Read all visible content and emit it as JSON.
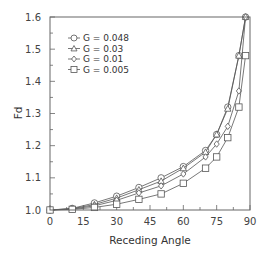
{
  "chart_data": {
    "type": "line",
    "title": "",
    "xlabel": "Receding Angle",
    "ylabel": "Fd",
    "xlim": [
      0,
      90
    ],
    "ylim": [
      1.0,
      1.6
    ],
    "xticks": [
      0,
      15,
      30,
      45,
      60,
      75,
      90
    ],
    "xtick_labels": [
      "0",
      "15",
      "30",
      "45",
      "60",
      "75",
      "90"
    ],
    "yticks": [
      1.0,
      1.1,
      1.2,
      1.3,
      1.4,
      1.5,
      1.6
    ],
    "ytick_labels": [
      "1.0",
      "1.1",
      "1.2",
      "1.3",
      "1.4",
      "1.5",
      "1.6"
    ],
    "grid": false,
    "legend_position": "upper-left",
    "series": [
      {
        "name": "G = 0.048",
        "marker": "circle",
        "x": [
          0,
          10,
          20,
          30,
          40,
          50,
          60,
          70,
          75,
          80,
          85,
          88
        ],
        "y": [
          1.0,
          1.005,
          1.022,
          1.043,
          1.07,
          1.1,
          1.135,
          1.185,
          1.235,
          1.32,
          1.48,
          1.6
        ]
      },
      {
        "name": "G = 0.03",
        "marker": "triangle",
        "x": [
          0,
          10,
          20,
          30,
          40,
          50,
          60,
          70,
          75,
          80,
          85,
          88
        ],
        "y": [
          1.0,
          1.004,
          1.017,
          1.037,
          1.063,
          1.09,
          1.13,
          1.18,
          1.235,
          1.315,
          1.48,
          1.6
        ]
      },
      {
        "name": "G = 0.01",
        "marker": "diamond",
        "x": [
          0,
          10,
          20,
          30,
          40,
          50,
          60,
          70,
          75,
          80,
          85,
          88
        ],
        "y": [
          1.0,
          1.003,
          1.013,
          1.03,
          1.053,
          1.075,
          1.112,
          1.165,
          1.205,
          1.26,
          1.37,
          1.6
        ]
      },
      {
        "name": "G = 0.005",
        "marker": "square",
        "x": [
          0,
          10,
          20,
          30,
          40,
          50,
          60,
          70,
          75,
          80,
          85,
          88
        ],
        "y": [
          1.0,
          1.002,
          1.008,
          1.018,
          1.033,
          1.05,
          1.083,
          1.13,
          1.165,
          1.225,
          1.32,
          1.48
        ]
      }
    ]
  },
  "legend": {
    "items": [
      {
        "label": "G = 0.048",
        "marker": "circle-icon"
      },
      {
        "label": "G = 0.03",
        "marker": "triangle-icon"
      },
      {
        "label": "G = 0.01",
        "marker": "diamond-icon"
      },
      {
        "label": "G = 0.005",
        "marker": "square-icon"
      }
    ]
  },
  "style": {
    "line_color": "#555555",
    "axis_color": "#666666",
    "marker_fill": "#ffffff"
  }
}
